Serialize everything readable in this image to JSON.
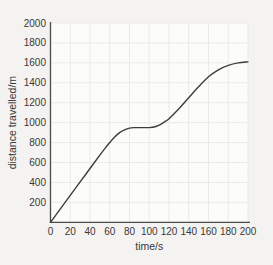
{
  "chart_data": {
    "type": "line",
    "title": "",
    "xlabel": "time/s",
    "ylabel": "distance travelled/m",
    "xlim": [
      0,
      200
    ],
    "ylim": [
      0,
      2000
    ],
    "x_ticks": [
      0,
      20,
      40,
      60,
      80,
      100,
      120,
      140,
      160,
      180,
      200
    ],
    "y_ticks": [
      200,
      400,
      600,
      800,
      1000,
      1200,
      1400,
      1600,
      1800,
      2000
    ],
    "grid": true,
    "legend": "none",
    "series": [
      {
        "name": "distance travelled",
        "x": [
          0,
          10,
          20,
          30,
          40,
          50,
          55,
          60,
          65,
          70,
          75,
          80,
          85,
          90,
          95,
          100,
          105,
          110,
          115,
          120,
          130,
          140,
          150,
          160,
          170,
          180,
          190,
          200
        ],
        "y": [
          0,
          135,
          270,
          405,
          540,
          675,
          740,
          800,
          855,
          900,
          928,
          945,
          950,
          950,
          950,
          950,
          956,
          975,
          1005,
          1040,
          1140,
          1250,
          1360,
          1460,
          1530,
          1575,
          1600,
          1610
        ]
      }
    ]
  },
  "colors": {
    "background": "#f4f3f1",
    "plot_background": "#fcfcfb",
    "grid": "#eaeae7",
    "axis": "#4a4a4a",
    "line": "#3d3d3d",
    "text": "#383838"
  }
}
